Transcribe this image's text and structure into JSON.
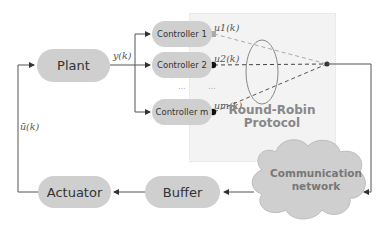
{
  "diagram": {
    "type": "block-diagram",
    "blocks": {
      "plant": "Plant",
      "controllers": [
        "Controller 1",
        "Controller 2",
        "Controller m"
      ],
      "actuator": "Actuator",
      "buffer": "Buffer",
      "network": [
        "Communication",
        "network"
      ]
    },
    "protocol": [
      "Round-Robin",
      "Protocol"
    ],
    "signals": {
      "plant_output": "y(k)",
      "controller_outputs": [
        "u1(k)",
        "u2(k)",
        "um(k)"
      ],
      "actuator_input": "ū(k)"
    },
    "ellipsis": [
      "...",
      "..."
    ],
    "colors": {
      "block_fill": "#cfcfcf",
      "protocol_bg": "#f3f3f3",
      "wire": "#555555",
      "dashed": "#666666"
    },
    "connections": [
      {
        "from": "Plant",
        "to": "Controller 1/2/m",
        "label": "y(k)"
      },
      {
        "from": "Controllers",
        "to": "Round-Robin switch",
        "labels": [
          "u1(k)",
          "u2(k)",
          "um(k)"
        ]
      },
      {
        "from": "Round-Robin switch",
        "to": "Communication network"
      },
      {
        "from": "Communication network",
        "to": "Buffer"
      },
      {
        "from": "Buffer",
        "to": "Actuator"
      },
      {
        "from": "Actuator",
        "to": "Plant",
        "label": "ū(k)"
      }
    ]
  }
}
